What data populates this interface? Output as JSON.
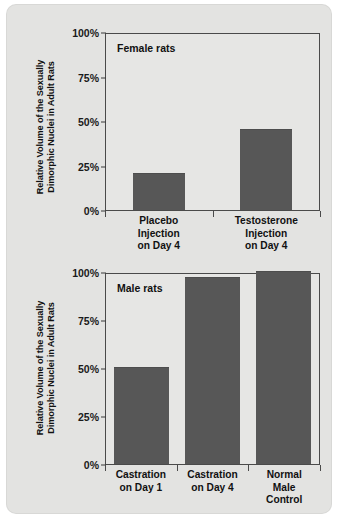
{
  "figure": {
    "y_axis_title_line1": "Relative Volume of the Sexually",
    "y_axis_title_line2": "Dimorphic Nuclei in Adult Rats"
  },
  "chart_data": [
    {
      "type": "bar",
      "title": "Female rats",
      "categories": [
        "Placebo Injection on Day 4",
        "Testosterone Injection on Day 4"
      ],
      "category_lines": [
        [
          "Placebo",
          "Injection",
          "on Day 4"
        ],
        [
          "Testosterone",
          "Injection",
          "on Day 4"
        ]
      ],
      "values": [
        20,
        45
      ],
      "xlabel": "",
      "ylabel": "Relative Volume of the Sexually Dimorphic Nuclei in Adult Rats",
      "ylim": [
        0,
        100
      ],
      "yticks": [
        0,
        25,
        50,
        75,
        100
      ],
      "ytick_labels": [
        "0%",
        "25%",
        "50%",
        "75%",
        "100%"
      ],
      "grid": false,
      "legend": "none",
      "bar_color": "#575757"
    },
    {
      "type": "bar",
      "title": "Male rats",
      "categories": [
        "Castration on Day 1",
        "Castration on Day 4",
        "Normal Male Control"
      ],
      "category_lines": [
        [
          "Castration",
          "on Day 1"
        ],
        [
          "Castration",
          "on Day 4"
        ],
        [
          "Normal",
          "Male",
          "Control"
        ]
      ],
      "values": [
        50,
        97,
        100
      ],
      "xlabel": "",
      "ylabel": "Relative Volume of the Sexually Dimorphic Nuclei in Adult Rats",
      "ylim": [
        0,
        100
      ],
      "yticks": [
        0,
        25,
        50,
        75,
        100
      ],
      "ytick_labels": [
        "0%",
        "25%",
        "50%",
        "75%",
        "100%"
      ],
      "grid": false,
      "legend": "none",
      "bar_color": "#575757"
    }
  ]
}
